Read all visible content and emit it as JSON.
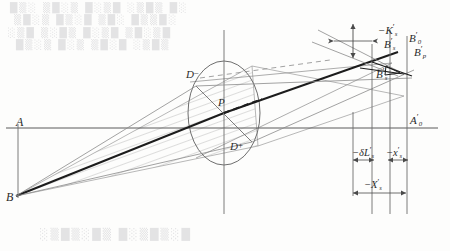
{
  "figure": {
    "type": "optical-ray-diagram",
    "title_visible": false,
    "background_bleed": [
      "█▒░ ▒█░▒ █░▒█ ░▒█▒ █░",
      "▒█░▒ █▒░█ ▒█░ █▒▒█░",
      "░▒█ ▒░█▒ █░▒█ ▒█░▒█",
      "█▒░▒ █░▒ ▒█░█ ░▒█▒"
    ],
    "bottom_bleed": "░▒█▒░█▒ █░▒█▒░█"
  },
  "labels": {
    "object_A": {
      "text": "A",
      "prime": "",
      "sub": ""
    },
    "object_B": {
      "text": "B",
      "prime": "",
      "sub": ""
    },
    "pupil_upper": {
      "text": "D",
      "sup": "−"
    },
    "pupil_lower": {
      "text": "D",
      "sup": "+"
    },
    "pupil_center": {
      "text": "P"
    },
    "image_A0": {
      "text": "A",
      "prime": "′",
      "sub": "0"
    },
    "image_Bs_top": {
      "text": "B",
      "prime": "′",
      "sub": "s"
    },
    "image_B0": {
      "text": "B",
      "prime": "′",
      "sub": "0"
    },
    "image_Bp": {
      "text": "B",
      "prime": "′",
      "sub": "p"
    },
    "image_Bs_low": {
      "text": "B",
      "prime": "′",
      "sub": "s"
    },
    "coma_K": {
      "text": "−K",
      "prime": "′",
      "sub": "s"
    },
    "dim_deltaL": {
      "text": "−δL",
      "prime": "′",
      "sub": "s"
    },
    "dim_xs": {
      "text": "−x",
      "prime": "′",
      "sub": "s"
    },
    "dim_Xs": {
      "text": "−X",
      "prime": "′",
      "sub": "s"
    }
  },
  "colors": {
    "axis": "#5a5a5a",
    "ray_main": "#1c1c1c",
    "ray_thin": "#8a8a8a",
    "hatch": "#9a9a9a",
    "pupil": "#6e6e6e",
    "dim": "#4a4a4a",
    "bleed": "#cfcfd2",
    "paper": "#fdfdfc"
  },
  "geometry": {
    "optical_axis_y": 128,
    "object_plane_x": 18,
    "pupil_center": [
      224,
      113
    ],
    "pupil_rx": 36,
    "pupil_ry": 52,
    "source_B": [
      16,
      196
    ],
    "image_plane_x": 407,
    "sagittal_plane_x": 372,
    "tangential_plane_x": 390
  }
}
